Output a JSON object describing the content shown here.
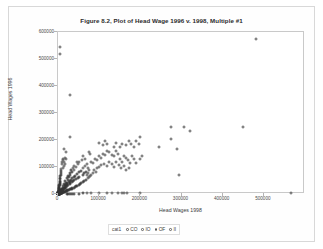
{
  "chart_data": {
    "type": "scatter",
    "title": "Figure 8.2, Plot of Head Wage 1996 v. 1998, Multiple #1",
    "xlabel": "Head Wages 1998",
    "ylabel": "Head Wages 1996",
    "xlim": [
      0,
      600000
    ],
    "ylim": [
      0,
      600000
    ],
    "grid": false,
    "xticks": [
      0,
      100000,
      200000,
      300000,
      400000,
      500000
    ],
    "xtick_labels": [
      "0",
      "100000",
      "200000",
      "300000",
      "400000",
      "500000"
    ],
    "yticks": [
      0,
      100000,
      200000,
      300000,
      400000,
      500000,
      600000
    ],
    "ytick_labels": [
      "0",
      "100000",
      "200000",
      "300000",
      "400000",
      "500000",
      "600000"
    ],
    "legend": {
      "title": "cat1",
      "position": "bottom",
      "entries": [
        {
          "label": "CO",
          "marker": "open-circle"
        },
        {
          "label": "IO",
          "marker": "open-circle"
        },
        {
          "label": "OF",
          "marker": "open-circle"
        },
        {
          "label": "II",
          "marker": "open-circle"
        }
      ]
    },
    "points": [
      [
        5000,
        545000
      ],
      [
        4000,
        520000
      ],
      [
        30000,
        365000
      ],
      [
        480000,
        575000
      ],
      [
        450000,
        250000
      ],
      [
        275000,
        250000
      ],
      [
        305000,
        250000
      ],
      [
        320000,
        235000
      ],
      [
        275000,
        205000
      ],
      [
        200000,
        210000
      ],
      [
        30000,
        210000
      ],
      [
        245000,
        175000
      ],
      [
        290000,
        165000
      ],
      [
        295000,
        70000
      ],
      [
        565000,
        3000
      ],
      [
        15000,
        165000
      ],
      [
        20000,
        155000
      ],
      [
        75000,
        155000
      ],
      [
        78000,
        150000
      ],
      [
        100000,
        190000
      ],
      [
        110000,
        180000
      ],
      [
        115000,
        195000
      ],
      [
        120000,
        185000
      ],
      [
        135000,
        175000
      ],
      [
        142000,
        190000
      ],
      [
        150000,
        175000
      ],
      [
        155000,
        185000
      ],
      [
        165000,
        180000
      ],
      [
        172000,
        195000
      ],
      [
        178000,
        185000
      ],
      [
        185000,
        175000
      ],
      [
        190000,
        195000
      ],
      [
        196000,
        185000
      ],
      [
        200000,
        130000
      ],
      [
        205000,
        140000
      ],
      [
        60000,
        140000
      ],
      [
        65000,
        130000
      ],
      [
        52000,
        120000
      ],
      [
        58000,
        125000
      ],
      [
        45000,
        118000
      ],
      [
        48000,
        112000
      ],
      [
        40000,
        105000
      ],
      [
        44000,
        100000
      ],
      [
        36000,
        95000
      ],
      [
        39000,
        90000
      ],
      [
        32000,
        88000
      ],
      [
        35000,
        82000
      ],
      [
        28000,
        78000
      ],
      [
        30000,
        72000
      ],
      [
        25000,
        68000
      ],
      [
        27000,
        62000
      ],
      [
        22000,
        58000
      ],
      [
        24000,
        52000
      ],
      [
        18000,
        48000
      ],
      [
        20000,
        42000
      ],
      [
        15000,
        38000
      ],
      [
        17000,
        32000
      ],
      [
        12000,
        28000
      ],
      [
        14000,
        22000
      ],
      [
        9000,
        18000
      ],
      [
        11000,
        14000
      ],
      [
        7000,
        10000
      ],
      [
        8000,
        7000
      ],
      [
        5000,
        5000
      ],
      [
        6000,
        3000
      ],
      [
        3000,
        2000
      ],
      [
        4000,
        1500
      ],
      [
        2000,
        1000
      ],
      [
        2500,
        800
      ],
      [
        1500,
        600
      ],
      [
        1800,
        400
      ],
      [
        1000,
        300
      ],
      [
        1200,
        200
      ],
      [
        80000,
        120000
      ],
      [
        85000,
        115000
      ],
      [
        90000,
        130000
      ],
      [
        95000,
        125000
      ],
      [
        100000,
        140000
      ],
      [
        105000,
        135000
      ],
      [
        110000,
        150000
      ],
      [
        115000,
        145000
      ],
      [
        120000,
        160000
      ],
      [
        125000,
        155000
      ],
      [
        130000,
        145000
      ],
      [
        135000,
        140000
      ],
      [
        140000,
        160000
      ],
      [
        145000,
        150000
      ],
      [
        150000,
        130000
      ],
      [
        155000,
        120000
      ],
      [
        160000,
        140000
      ],
      [
        165000,
        135000
      ],
      [
        170000,
        125000
      ],
      [
        175000,
        115000
      ],
      [
        180000,
        140000
      ],
      [
        185000,
        130000
      ],
      [
        190000,
        115000
      ],
      [
        60000,
        95000
      ],
      [
        65000,
        105000
      ],
      [
        70000,
        110000
      ],
      [
        72000,
        98000
      ],
      [
        75000,
        90000
      ],
      [
        55000,
        85000
      ],
      [
        50000,
        80000
      ],
      [
        45000,
        75000
      ],
      [
        42000,
        68000
      ],
      [
        38000,
        62000
      ],
      [
        34000,
        58000
      ],
      [
        31000,
        52000
      ],
      [
        29000,
        48000
      ],
      [
        26000,
        44000
      ],
      [
        23000,
        40000
      ],
      [
        21000,
        36000
      ],
      [
        19000,
        32000
      ],
      [
        16000,
        28000
      ],
      [
        13000,
        24000
      ],
      [
        10000,
        20000
      ],
      [
        8500,
        16000
      ],
      [
        7000,
        13000
      ],
      [
        6000,
        10000
      ],
      [
        5000,
        8000
      ],
      [
        4000,
        6000
      ],
      [
        3500,
        4000
      ],
      [
        3000,
        3000
      ],
      [
        2800,
        2200
      ],
      [
        2400,
        1800
      ],
      [
        2000,
        1400
      ],
      [
        1700,
        1000
      ],
      [
        1400,
        700
      ],
      [
        1100,
        500
      ],
      [
        900,
        350
      ],
      [
        700,
        250
      ],
      [
        500,
        150
      ],
      [
        400,
        100
      ],
      [
        95000,
        95000
      ],
      [
        100000,
        100000
      ],
      [
        105000,
        108000
      ],
      [
        112000,
        112000
      ],
      [
        118000,
        105000
      ],
      [
        124000,
        118000
      ],
      [
        130000,
        110000
      ],
      [
        136000,
        100000
      ],
      [
        142000,
        120000
      ],
      [
        148000,
        108000
      ],
      [
        154000,
        95000
      ],
      [
        160000,
        105000
      ],
      [
        166000,
        88000
      ],
      [
        172000,
        98000
      ],
      [
        60000,
        72000
      ],
      [
        64000,
        78000
      ],
      [
        68000,
        82000
      ],
      [
        70000,
        70000
      ],
      [
        74000,
        76000
      ],
      [
        78000,
        68000
      ],
      [
        52000,
        64000
      ],
      [
        48000,
        60000
      ],
      [
        44000,
        56000
      ],
      [
        40000,
        52000
      ],
      [
        36000,
        48000
      ],
      [
        33000,
        44000
      ],
      [
        30000,
        40000
      ],
      [
        28000,
        36000
      ],
      [
        25000,
        33000
      ],
      [
        22000,
        30000
      ],
      [
        20000,
        27000
      ],
      [
        18000,
        24000
      ],
      [
        16000,
        21000
      ],
      [
        14000,
        18000
      ],
      [
        12000,
        15000
      ],
      [
        10000,
        12500
      ],
      [
        9000,
        11000
      ],
      [
        8000,
        9500
      ],
      [
        7000,
        8000
      ],
      [
        6500,
        7000
      ],
      [
        6000,
        6000
      ],
      [
        5500,
        5200
      ],
      [
        5000,
        4500
      ],
      [
        4500,
        4000
      ],
      [
        4000,
        3500
      ],
      [
        3600,
        3000
      ],
      [
        3200,
        2600
      ],
      [
        2900,
        2200
      ],
      [
        2600,
        1900
      ],
      [
        2300,
        1600
      ],
      [
        2000,
        1300
      ],
      [
        1800,
        1100
      ],
      [
        1600,
        900
      ],
      [
        1400,
        750
      ],
      [
        1200,
        600
      ],
      [
        1000,
        480
      ],
      [
        850,
        380
      ],
      [
        700,
        300
      ],
      [
        600,
        240
      ],
      [
        500,
        190
      ],
      [
        420,
        150
      ],
      [
        350,
        120
      ],
      [
        300,
        95
      ],
      [
        250,
        75
      ],
      [
        200,
        60
      ],
      [
        160,
        45
      ],
      [
        130,
        35
      ],
      [
        100,
        25
      ],
      [
        145000,
        5000
      ],
      [
        155000,
        5000
      ],
      [
        160000,
        4000
      ],
      [
        168000,
        4000
      ],
      [
        100000,
        3000
      ],
      [
        80000,
        2500
      ],
      [
        70000,
        2000
      ],
      [
        60000,
        2000
      ],
      [
        50000,
        1500
      ],
      [
        40000,
        1500
      ],
      [
        120000,
        3000
      ],
      [
        130000,
        2500
      ],
      [
        35000,
        1200
      ],
      [
        30000,
        1000
      ],
      [
        25000,
        900
      ],
      [
        22000,
        800
      ],
      [
        200000,
        2000
      ],
      [
        15000,
        120000
      ],
      [
        16000,
        112000
      ],
      [
        14000,
        105000
      ],
      [
        13000,
        98000
      ],
      [
        12000,
        130000
      ],
      [
        11000,
        125000
      ],
      [
        10000,
        118000
      ],
      [
        9500,
        110000
      ],
      [
        18000,
        135000
      ],
      [
        19000,
        128000
      ],
      [
        8000,
        92000
      ],
      [
        7500,
        85000
      ],
      [
        7000,
        78000
      ],
      [
        6500,
        72000
      ],
      [
        6000,
        66000
      ],
      [
        5500,
        60000
      ],
      [
        5000,
        55000
      ],
      [
        4800,
        50000
      ],
      [
        4500,
        46000
      ],
      [
        4200,
        42000
      ],
      [
        4000,
        38000
      ],
      [
        3800,
        35000
      ],
      [
        3500,
        32000
      ],
      [
        3200,
        29000
      ],
      [
        3000,
        26000
      ],
      [
        2800,
        23000
      ],
      [
        2600,
        21000
      ],
      [
        2400,
        19000
      ],
      [
        2200,
        17000
      ],
      [
        2000,
        15000
      ],
      [
        1900,
        13500
      ],
      [
        1800,
        12000
      ],
      [
        1700,
        11000
      ],
      [
        1600,
        10000
      ],
      [
        1500,
        9000
      ],
      [
        1400,
        8200
      ],
      [
        1300,
        7400
      ],
      [
        1200,
        6600
      ],
      [
        1100,
        6000
      ],
      [
        1000,
        5400
      ],
      [
        950,
        4800
      ],
      [
        900,
        4300
      ],
      [
        850,
        3900
      ],
      [
        800,
        3500
      ],
      [
        750,
        3100
      ],
      [
        700,
        2800
      ],
      [
        650,
        2500
      ],
      [
        600,
        2200
      ],
      [
        550,
        1900
      ],
      [
        500,
        1700
      ],
      [
        460,
        1500
      ],
      [
        420,
        1300
      ],
      [
        380,
        1150
      ],
      [
        340,
        1000
      ],
      [
        300,
        880
      ],
      [
        270,
        760
      ],
      [
        240,
        650
      ],
      [
        210,
        560
      ],
      [
        185,
        480
      ],
      [
        160,
        410
      ],
      [
        140,
        350
      ],
      [
        120,
        300
      ],
      [
        100,
        250
      ],
      [
        85,
        210
      ],
      [
        70,
        170
      ],
      [
        55,
        140
      ],
      [
        45,
        110
      ],
      [
        35,
        90
      ],
      [
        28,
        70
      ],
      [
        20,
        55
      ],
      [
        88000,
        88000
      ],
      [
        92000,
        82000
      ],
      [
        84000,
        76000
      ],
      [
        80000,
        70000
      ],
      [
        76000,
        64000
      ],
      [
        72000,
        58000
      ],
      [
        68000,
        53000
      ],
      [
        64000,
        48000
      ],
      [
        60000,
        44000
      ],
      [
        56000,
        40000
      ],
      [
        53000,
        37000
      ],
      [
        50000,
        34000
      ],
      [
        47000,
        31000
      ],
      [
        44000,
        28000
      ],
      [
        41000,
        26000
      ],
      [
        38000,
        24000
      ],
      [
        35000,
        22000
      ],
      [
        33000,
        20000
      ],
      [
        31000,
        18500
      ],
      [
        29000,
        17000
      ],
      [
        27000,
        15500
      ],
      [
        25000,
        14000
      ],
      [
        23000,
        13000
      ],
      [
        21500,
        12000
      ],
      [
        20000,
        11000
      ],
      [
        18500,
        10000
      ],
      [
        17000,
        9200
      ],
      [
        15500,
        8400
      ],
      [
        14000,
        7700
      ],
      [
        13000,
        7000
      ],
      [
        12000,
        6400
      ],
      [
        11000,
        5800
      ],
      [
        10200,
        5300
      ],
      [
        9400,
        4800
      ],
      [
        8700,
        4400
      ],
      [
        8000,
        4000
      ],
      [
        7400,
        3600
      ],
      [
        6800,
        3300
      ],
      [
        6200,
        3000
      ],
      [
        5700,
        2700
      ],
      [
        5200,
        2450
      ],
      [
        4800,
        2200
      ],
      [
        4400,
        2000
      ],
      [
        4000,
        1800
      ],
      [
        3700,
        1620
      ],
      [
        3400,
        1460
      ],
      [
        3100,
        1320
      ],
      [
        2850,
        1180
      ],
      [
        2600,
        1060
      ],
      [
        2400,
        950
      ],
      [
        2200,
        860
      ],
      [
        2000,
        770
      ],
      [
        1850,
        690
      ],
      [
        1700,
        620
      ],
      [
        1550,
        550
      ],
      [
        1420,
        495
      ],
      [
        1300,
        445
      ],
      [
        1190,
        400
      ],
      [
        1090,
        360
      ],
      [
        1000,
        320
      ],
      [
        915,
        288
      ],
      [
        840,
        258
      ],
      [
        770,
        232
      ],
      [
        705,
        208
      ],
      [
        645,
        187
      ],
      [
        590,
        168
      ],
      [
        540,
        151
      ],
      [
        495,
        135
      ],
      [
        450,
        121
      ],
      [
        412,
        109
      ],
      [
        377,
        98
      ],
      [
        345,
        88
      ],
      [
        315,
        79
      ],
      [
        288,
        71
      ],
      [
        263,
        63
      ],
      [
        240,
        57
      ],
      [
        220,
        51
      ],
      [
        200,
        46
      ]
    ]
  }
}
